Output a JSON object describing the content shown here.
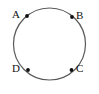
{
  "figure": {
    "type": "geometry-diagram",
    "canvas": {
      "width": 99,
      "height": 94,
      "background": "#ffffff"
    },
    "circle": {
      "name": "circle",
      "cx": 49.5,
      "cy": 44,
      "r": 36,
      "stroke": "#5a5a5a",
      "stroke_width": 1.2,
      "fill": "none"
    },
    "point_style": {
      "radius": 1.9,
      "fill": "#111111"
    },
    "points": [
      {
        "id": "A",
        "label": "A",
        "x": 27.0,
        "y": 16.0,
        "label_x": 12,
        "label_y": 9,
        "label_anchor": "right-of-label"
      },
      {
        "id": "B",
        "label": "B",
        "x": 72.0,
        "y": 17.0,
        "label_x": 76,
        "label_y": 10,
        "label_anchor": "left-of-label"
      },
      {
        "id": "C",
        "label": "C",
        "x": 71.5,
        "y": 70.0,
        "label_x": 76,
        "label_y": 63,
        "label_anchor": "left-of-label"
      },
      {
        "id": "D",
        "label": "D",
        "x": 28.0,
        "y": 70.0,
        "label_x": 12,
        "label_y": 63,
        "label_anchor": "right-of-label"
      }
    ]
  }
}
